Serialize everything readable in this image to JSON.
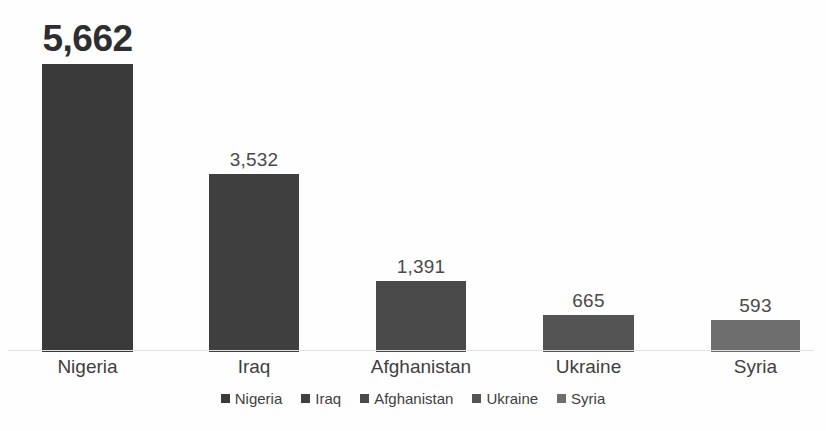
{
  "chart_data": {
    "type": "bar",
    "title": "",
    "subtitle": "",
    "xlabel": "",
    "ylabel": "",
    "categories": [
      "Nigeria",
      "Iraq",
      "Afghanistan",
      "Ukraine",
      "Syria"
    ],
    "values": [
      5662,
      3532,
      1391,
      665,
      593
    ],
    "value_labels": [
      "5,662",
      "3,532",
      "1,391",
      "665",
      "593"
    ],
    "ylim": [
      0,
      5662
    ],
    "grid": false,
    "axis_line": true,
    "legend_position": "bottom",
    "legend_entries": [
      "Nigeria",
      "Iraq",
      "Afghanistan",
      "Ukraine",
      "Syria"
    ],
    "series": [
      {
        "name": "Fatalities",
        "values": [
          5662,
          3532,
          1391,
          665,
          593
        ]
      }
    ],
    "colors": [
      "#3a3a3a",
      "#3f3f3f",
      "#4a4a4a",
      "#545454",
      "#6e6e6e"
    ],
    "emphasis_index": 0
  },
  "bars": [
    {
      "category": "Nigeria",
      "value": 5662,
      "label": "5,662",
      "color": "#3a3a3a",
      "left": 42,
      "width": 91,
      "height": 288,
      "emphasis": true
    },
    {
      "category": "Iraq",
      "value": 3532,
      "label": "3,532",
      "color": "#3f3f3f",
      "left": 209,
      "width": 90,
      "height": 178,
      "emphasis": false
    },
    {
      "category": "Afghanistan",
      "value": 1391,
      "label": "1,391",
      "color": "#4a4a4a",
      "left": 376,
      "width": 90,
      "height": 71,
      "emphasis": false
    },
    {
      "category": "Ukraine",
      "value": 665,
      "label": "665",
      "color": "#545454",
      "left": 543,
      "width": 91,
      "height": 37,
      "emphasis": false
    },
    {
      "category": "Syria",
      "value": 593,
      "label": "593",
      "color": "#6e6e6e",
      "left": 711,
      "width": 89,
      "height": 32,
      "emphasis": false
    }
  ],
  "categories": [
    {
      "label": "Nigeria",
      "left": 22,
      "width": 131
    },
    {
      "label": "Iraq",
      "left": 189,
      "width": 130
    },
    {
      "label": "Afghanistan",
      "left": 356,
      "width": 130
    },
    {
      "label": "Ukraine",
      "left": 523,
      "width": 131
    },
    {
      "label": "Syria",
      "left": 691,
      "width": 129
    }
  ],
  "legend": [
    {
      "label": "Nigeria",
      "color": "#3a3a3a"
    },
    {
      "label": "Iraq",
      "color": "#3f3f3f"
    },
    {
      "label": "Afghanistan",
      "color": "#4a4a4a"
    },
    {
      "label": "Ukraine",
      "color": "#545454"
    },
    {
      "label": "Syria",
      "color": "#6e6e6e"
    }
  ]
}
